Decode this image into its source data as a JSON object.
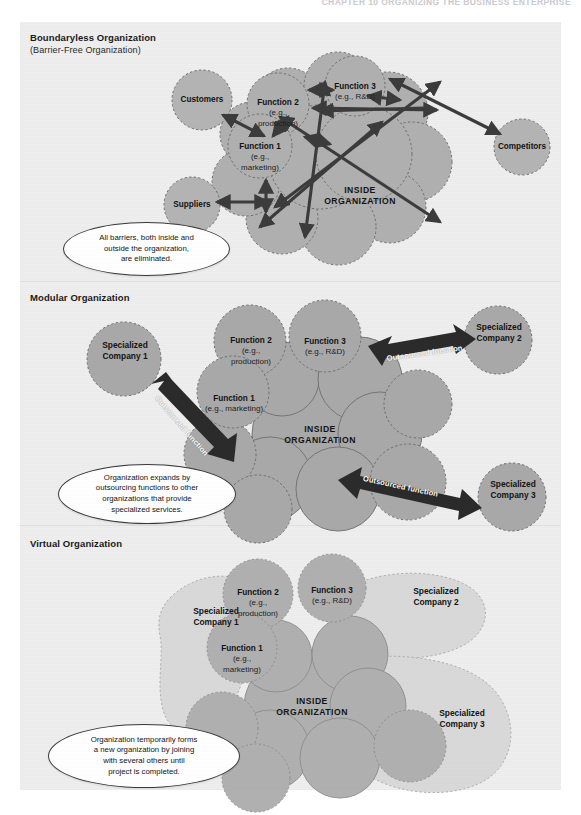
{
  "chapter_header": "CHAPTER 10    ORGANIZING THE BUSINESS ENTERPRISE",
  "colors": {
    "figure_background": "#eeeeee",
    "page_background": "#ffffff",
    "circle_dark": "#a8a8a8",
    "circle_mid": "#b5b5b5",
    "circle_light": "#d8d8d8",
    "circle_outline": "#7e7e7e",
    "arrow": "#3c3c3c",
    "callout_border": "#3a3a3a",
    "text": "#131313"
  },
  "panels": [
    {
      "id": "boundaryless",
      "title": "Boundaryless Organization",
      "subtitle": "(Barrier-Free Organization)",
      "inside_label": "INSIDE\nORGANIZATION",
      "callout": "All barriers, both inside and\noutside the organization,\nare eliminated.",
      "nodes": [
        {
          "name": "customers",
          "label": "Customers"
        },
        {
          "name": "suppliers",
          "label": "Suppliers"
        },
        {
          "name": "competitors",
          "label": "Competitors"
        },
        {
          "name": "function-1",
          "label": "Function 1",
          "eg": "(e.g.,\nmarketing)"
        },
        {
          "name": "function-2",
          "label": "Function 2",
          "eg": "(e.g.,\nproduction)"
        },
        {
          "name": "function-3",
          "label": "Function 3",
          "eg": "(e.g., R&D)"
        }
      ]
    },
    {
      "id": "modular",
      "title": "Modular Organization",
      "subtitle": "",
      "inside_label": "INSIDE\nORGANIZATION",
      "callout": "Organization expands by\noutsourcing functions to other\norganizations that provide\nspecialized services.",
      "arrow_labels": [
        "Outsourced function",
        "Outsourced function",
        "Outsourced function"
      ],
      "nodes": [
        {
          "name": "specialized-company-1",
          "label": "Specialized\nCompany 1"
        },
        {
          "name": "specialized-company-2",
          "label": "Specialized\nCompany 2"
        },
        {
          "name": "specialized-company-3",
          "label": "Specialized\nCompany 3"
        },
        {
          "name": "function-1",
          "label": "Function 1",
          "eg": "(e.g., marketing)"
        },
        {
          "name": "function-2",
          "label": "Function 2",
          "eg": "(e.g.,\nproduction)"
        },
        {
          "name": "function-3",
          "label": "Function 3",
          "eg": "(e.g., R&D)"
        }
      ]
    },
    {
      "id": "virtual",
      "title": "Virtual Organization",
      "subtitle": "",
      "inside_label": "INSIDE\nORGANIZATION",
      "callout": "Organization temporarily forms\na new organization by joining\nwith several others until\nproject is completed.",
      "nodes": [
        {
          "name": "specialized-company-1",
          "label": "Specialized\nCompany 1"
        },
        {
          "name": "specialized-company-2",
          "label": "Specialized\nCompany 2"
        },
        {
          "name": "specialized-company-3",
          "label": "Specialized\nCompany 3"
        },
        {
          "name": "function-1",
          "label": "Function 1",
          "eg": "(e.g.,\nmarketing)"
        },
        {
          "name": "function-2",
          "label": "Function 2",
          "eg": "(e.g.,\nproduction)"
        },
        {
          "name": "function-3",
          "label": "Function 3",
          "eg": "(e.g., R&D)"
        }
      ]
    }
  ]
}
